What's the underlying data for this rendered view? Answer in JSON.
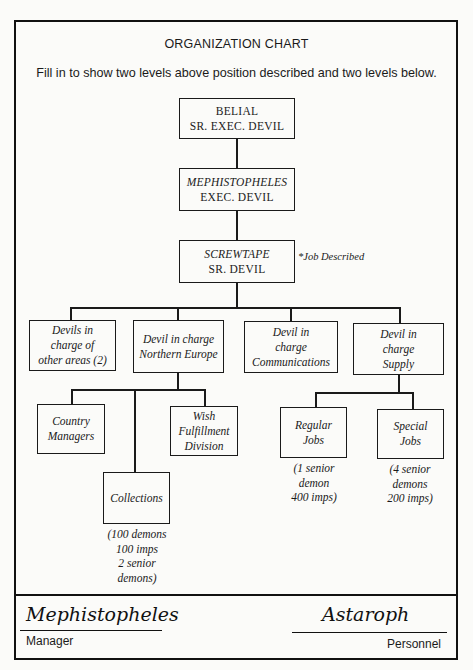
{
  "header": {
    "title": "ORGANIZATION CHART",
    "instructions": "Fill in to show two levels above position described and two levels below."
  },
  "chart": {
    "level1": {
      "name": "BELIAL",
      "title": "SR. EXEC. DEVIL"
    },
    "level2": {
      "name": "MEPHISTOPHELES",
      "title": "EXEC. DEVIL"
    },
    "level3": {
      "name": "SCREWTAPE",
      "title": "SR. DEVIL",
      "annotation": "*Job Described"
    },
    "level4": [
      {
        "lines": [
          "Devils in",
          "charge of",
          "other areas (2)"
        ]
      },
      {
        "lines": [
          "Devil in charge",
          "Northern Europe"
        ]
      },
      {
        "lines": [
          "Devil in",
          "charge",
          "Communications"
        ]
      },
      {
        "lines": [
          "Devil in",
          "charge",
          "Supply"
        ]
      }
    ],
    "northern_europe_children": [
      {
        "lines": [
          "Country",
          "Managers"
        ]
      },
      {
        "lines": [
          "Collections"
        ],
        "note": [
          "(100 demons",
          "100 imps",
          "2 senior",
          "demons)"
        ]
      },
      {
        "lines": [
          "Wish",
          "Fulfillment",
          "Division"
        ]
      }
    ],
    "supply_children": [
      {
        "lines": [
          "Regular",
          "Jobs"
        ],
        "note": [
          "(1 senior",
          "demon",
          "400 imps)"
        ]
      },
      {
        "lines": [
          "Special",
          "Jobs"
        ],
        "note": [
          "(4 senior",
          "demons",
          "200 imps)"
        ]
      }
    ]
  },
  "footer": {
    "manager_signature": "Mephistopheles",
    "manager_label": "Manager",
    "personnel_signature": "Astaroph",
    "personnel_label": "Personnel"
  }
}
